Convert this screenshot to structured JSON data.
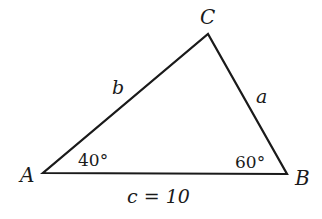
{
  "diagram": {
    "type": "triangle",
    "vertices": {
      "A": {
        "label": "A"
      },
      "B": {
        "label": "B"
      },
      "C": {
        "label": "C"
      }
    },
    "sides": {
      "a": {
        "label": "a"
      },
      "b": {
        "label": "b"
      },
      "c": {
        "label": "c = 10"
      }
    },
    "angles": {
      "A": {
        "label": "40°"
      },
      "B": {
        "label": "60°"
      }
    },
    "colors": {
      "stroke": "#1a1a1a",
      "background": "#ffffff"
    }
  }
}
